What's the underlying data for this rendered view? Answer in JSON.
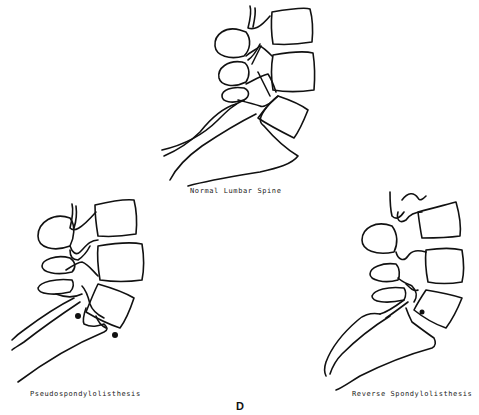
{
  "figure": {
    "panel_letter": "D",
    "panels": [
      {
        "id": "normal",
        "caption": "Normal Lumbar Spine"
      },
      {
        "id": "pseudo",
        "caption": "Pseudospondylolisthesis"
      },
      {
        "id": "reverse",
        "caption": "Reverse Spondylolisthesis"
      }
    ],
    "marker_color": "#111111",
    "line_color": "#111111"
  }
}
